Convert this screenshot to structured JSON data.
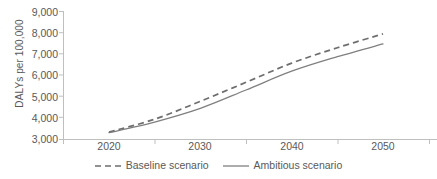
{
  "chart_data": {
    "type": "line",
    "title": "",
    "xlabel": "",
    "ylabel": "DALYs per 100,000",
    "x": [
      2020,
      2025,
      2030,
      2035,
      2040,
      2045,
      2050
    ],
    "xlim": [
      2017,
      2053
    ],
    "ylim": [
      3000,
      9000
    ],
    "xticks": [
      "2020",
      "2030",
      "2040",
      "2050"
    ],
    "yticks": [
      "3,000",
      "4,000",
      "5,000",
      "6,000",
      "7,000",
      "8,000",
      "9,000"
    ],
    "grid": false,
    "legend_position": "bottom-center",
    "series": [
      {
        "name": "Baseline scenario",
        "style": "dashed",
        "color": "#7f7f7f",
        "values": [
          3350,
          3950,
          4790,
          5680,
          6580,
          7300,
          7950
        ]
      },
      {
        "name": "Ambitious scenario",
        "style": "solid",
        "color": "#7f7f7f",
        "values": [
          3320,
          3820,
          4460,
          5320,
          6200,
          6880,
          7480
        ]
      }
    ]
  },
  "axis": {
    "y_title": "DALYs per 100,000",
    "y_tick_labels": [
      "9,000",
      "8,000",
      "7,000",
      "6,000",
      "5,000",
      "4,000",
      "3,000"
    ],
    "x_tick_labels": [
      "2020",
      "2030",
      "2040",
      "2050"
    ]
  },
  "legend": {
    "items": [
      {
        "label": "Baseline scenario",
        "style": "dashed"
      },
      {
        "label": "Ambitious scenario",
        "style": "solid"
      }
    ]
  },
  "colors": {
    "line": "#7f7f7f",
    "axis": "#bfbfbf",
    "text": "#595959",
    "background": "#ffffff"
  }
}
